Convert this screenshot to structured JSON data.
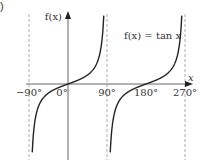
{
  "panel_label": ")",
  "chart_data": {
    "type": "line",
    "title": "f(x) = tan x",
    "function": "tan",
    "xlabel": "x",
    "ylabel": "f(x)",
    "x_ticks": [
      "−90°",
      "0°",
      "90°",
      "180°",
      "270°"
    ],
    "x_tick_values_deg": [
      -90,
      0,
      90,
      180,
      270
    ],
    "asymptotes_deg": [
      -90,
      90,
      270
    ],
    "xlim_deg": [
      -90,
      270
    ],
    "branches": [
      {
        "from_deg": -90,
        "to_deg": 90
      },
      {
        "from_deg": 90,
        "to_deg": 270
      }
    ],
    "grid": false,
    "legend": "none",
    "curve_color": "#222222",
    "axis_color": "#555555",
    "asymptote_color": "#999999"
  }
}
